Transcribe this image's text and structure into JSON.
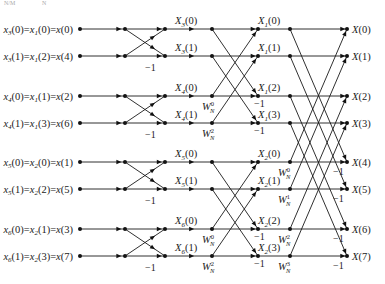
{
  "diagram": {
    "title_fragment": [
      "N/M",
      "N"
    ],
    "type": "8-point radix-2 decimation-in-time FFT signal flow graph",
    "inputs": [
      "x3(0)=x1(0)=x(0)",
      "x3(1)=x1(2)=x(4)",
      "x4(0)=x1(1)=x(2)",
      "x4(1)=x1(3)=x(6)",
      "x5(0)=x2(0)=x(1)",
      "x5(1)=x2(2)=x(5)",
      "x6(0)=x2(1)=x(3)",
      "x6(1)=x2(3)=x(7)"
    ],
    "stage1_outputs": [
      "X3(0)",
      "X3(1)",
      "X4(0)",
      "X4(1)",
      "X5(0)",
      "X5(1)",
      "X6(0)",
      "X6(1)"
    ],
    "stage2_outputs": [
      "X1(0)",
      "X1(1)",
      "X1(2)",
      "X1(3)",
      "X2(0)",
      "X2(1)",
      "X2(2)",
      "X2(3)"
    ],
    "outputs": [
      "X(0)",
      "X(1)",
      "X(2)",
      "X(3)",
      "X(4)",
      "X(5)",
      "X(6)",
      "X(7)"
    ],
    "stage2_twiddles": [
      "W_N^0",
      "W_N^2",
      "W_N^0",
      "W_N^2"
    ],
    "stage3_twiddles": [
      "W_N^0",
      "W_N^1",
      "W_N^2",
      "W_N^3"
    ],
    "minus_one": "−1"
  }
}
